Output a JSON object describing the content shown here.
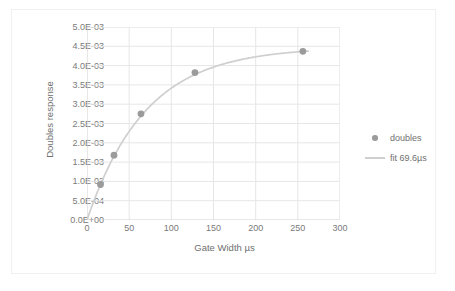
{
  "chart_data": {
    "type": "scatter",
    "title": "",
    "xlabel": "Gate Width µs",
    "ylabel": "Doubles response",
    "xlim": [
      0,
      300
    ],
    "ylim": [
      0,
      0.005
    ],
    "xticks": [
      0,
      50,
      100,
      150,
      200,
      250,
      300
    ],
    "xtick_labels": [
      "0",
      "50",
      "100",
      "150",
      "200",
      "250",
      "300"
    ],
    "yticks": [
      0,
      0.0005,
      0.001,
      0.0015,
      0.002,
      0.0025,
      0.003,
      0.0035,
      0.004,
      0.0045,
      0.005
    ],
    "ytick_labels": [
      "0.0E+00",
      "5.0E-04",
      "1.0E-03",
      "1.5E-03",
      "2.0E-03",
      "2.5E-03",
      "3.0E-03",
      "3.5E-03",
      "4.0E-03",
      "4.5E-03",
      "5.0E-03"
    ],
    "grid": true,
    "legend_position": "right",
    "series": [
      {
        "name": "doubles",
        "type": "scatter",
        "color": "#9b9b9b",
        "x": [
          16,
          32,
          64,
          128,
          256
        ],
        "y": [
          0.00092,
          0.00168,
          0.00275,
          0.00382,
          0.00437
        ]
      },
      {
        "name": "fit 69.6µs",
        "type": "line",
        "color": "#cfcfcf",
        "model": "saturating exponential",
        "amplitude": 0.00448,
        "time_constant_us": 69.6
      }
    ]
  },
  "legend": {
    "items": [
      {
        "label": "doubles",
        "marker": "dot",
        "color": "#9b9b9b"
      },
      {
        "label": "fit 69.6µs",
        "marker": "line",
        "color": "#cfcfcf"
      }
    ]
  },
  "colors": {
    "marker": "#9b9b9b",
    "fit_line": "#cfcfcf",
    "grid": "#e6e6e6",
    "axis": "#d0d0d0",
    "text": "#6f6f6f",
    "background": "#ffffff"
  }
}
